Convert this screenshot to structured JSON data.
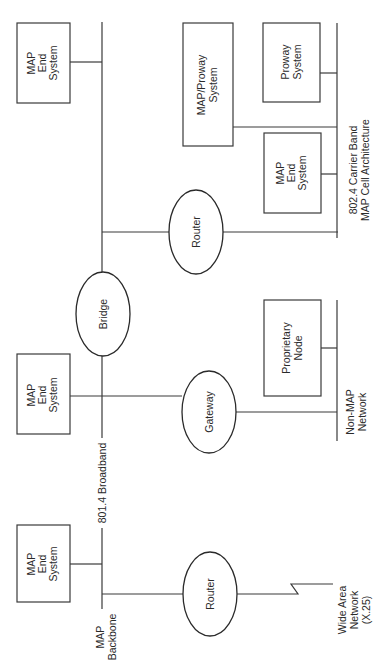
{
  "diagram": {
    "orientation": "rotated-90-ccw",
    "networks": {
      "backbone": {
        "line1": "MAP",
        "line2": "Backbone"
      },
      "broadband": {
        "label": "801.4 Broadband"
      },
      "carrier_band": {
        "line1": "802.4 Carrier Band",
        "line2": "MAP Cell Architecture"
      },
      "non_map": {
        "line1": "Non-MAP",
        "line2": "Network"
      },
      "wan": {
        "line1": "Wide Area",
        "line2": "Network",
        "line3": "(X.25)"
      }
    },
    "nodes": {
      "end_system_top": {
        "line1": "MAP",
        "line2": "End",
        "line3": "System"
      },
      "end_system_mid": {
        "line1": "MAP",
        "line2": "End",
        "line3": "System"
      },
      "end_system_bottom": {
        "line1": "MAP",
        "line2": "End",
        "line3": "System"
      },
      "end_system_cell": {
        "line1": "MAP",
        "line2": "End",
        "line3": "System"
      },
      "map_proway": {
        "line1": "MAP/Proway",
        "line2": "System"
      },
      "proway": {
        "line1": "Proway",
        "line2": "System"
      },
      "proprietary": {
        "line1": "Proprietary",
        "line2": "Node"
      },
      "router_cell": {
        "label": "Router"
      },
      "router_wan": {
        "label": "Router"
      },
      "bridge": {
        "label": "Bridge"
      },
      "gateway": {
        "label": "Gateway"
      }
    },
    "colors": {
      "stroke": "#3a3a3a",
      "background": "#ffffff",
      "text": "#2a2a2a"
    }
  }
}
